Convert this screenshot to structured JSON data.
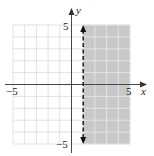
{
  "chart_data": {
    "type": "inequality-graph",
    "title": "",
    "inequality": "x > 1",
    "boundary": {
      "type": "vertical-line",
      "x": 1,
      "style": "dashed"
    },
    "shaded_region": "x > 1",
    "xlabel": "x",
    "ylabel": "y",
    "xlim": [
      -5,
      5
    ],
    "ylim": [
      -5,
      5
    ],
    "x_tick_labels": [
      "-5",
      "5"
    ],
    "y_tick_labels": [
      "5",
      "-5"
    ],
    "grid": true,
    "grid_step": 1
  },
  "labels": {
    "x_axis": "x",
    "y_axis": "y",
    "x_min": "−5",
    "x_max": "5",
    "y_max": "5",
    "y_min": "−5"
  },
  "colors": {
    "shade": "#c8c8c8",
    "grid_light": "#d9d9d9",
    "grid_on_shade": "#e6e6e6",
    "axis": "#333333",
    "boundary": "#111111"
  }
}
